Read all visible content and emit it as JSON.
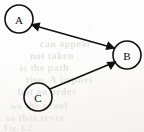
{
  "figure": {
    "kind": "directed-graph",
    "medium": "scanned-book-page",
    "background_color": "#fdfdfd",
    "ink_color": "#111111",
    "width": 144,
    "height": 132
  },
  "graph_data": {
    "type": "node-link-diagram",
    "directed": true,
    "nodes": [
      {
        "id": "A",
        "label": "A",
        "cx": 19,
        "cy": 19,
        "r": 14
      },
      {
        "id": "B",
        "label": "B",
        "cx": 127,
        "cy": 55,
        "r": 14
      },
      {
        "id": "C",
        "label": "C",
        "cx": 38,
        "cy": 97,
        "r": 14
      }
    ],
    "edges": [
      {
        "id": "edge-a-b",
        "source": "A",
        "target": "B",
        "arrow_at_source": true,
        "arrow_at_target": true,
        "style": "double-headed",
        "x1": 32,
        "y1": 25,
        "x2": 114,
        "y2": 48
      },
      {
        "id": "edge-c-b",
        "source": "C",
        "target": "B",
        "arrow_at_source": false,
        "arrow_at_target": true,
        "style": "single-headed",
        "x1": 50,
        "y1": 89,
        "x2": 115,
        "y2": 62
      }
    ],
    "edge_count": 2,
    "node_count": 3
  },
  "ghost_text": {
    "description": "faint illegible bleed-through text from the reverse side of the scanned page",
    "lines": [
      {
        "text": "can appear",
        "x": 40,
        "y": 38,
        "size": 10,
        "rotate": -0.6
      },
      {
        "text": "not taken",
        "x": 30,
        "y": 50,
        "size": 10,
        "rotate": -0.5
      },
      {
        "text": "is the path",
        "x": 20,
        "y": 62,
        "size": 10,
        "rotate": -0.4
      },
      {
        "text": "tion. A implies",
        "x": 26,
        "y": 74,
        "size": 10,
        "rotate": -0.5
      },
      {
        "text": "but an order",
        "x": 18,
        "y": 86,
        "size": 10,
        "rotate": -0.4
      },
      {
        "text": "we the proof",
        "x": 10,
        "y": 100,
        "size": 10,
        "rotate": -0.4
      },
      {
        "text": "so that rever",
        "x": 6,
        "y": 112,
        "size": 10,
        "rotate": -0.3
      },
      {
        "text": "Fig. 6.2",
        "x": 4,
        "y": 124,
        "size": 8,
        "rotate": 0
      }
    ]
  }
}
